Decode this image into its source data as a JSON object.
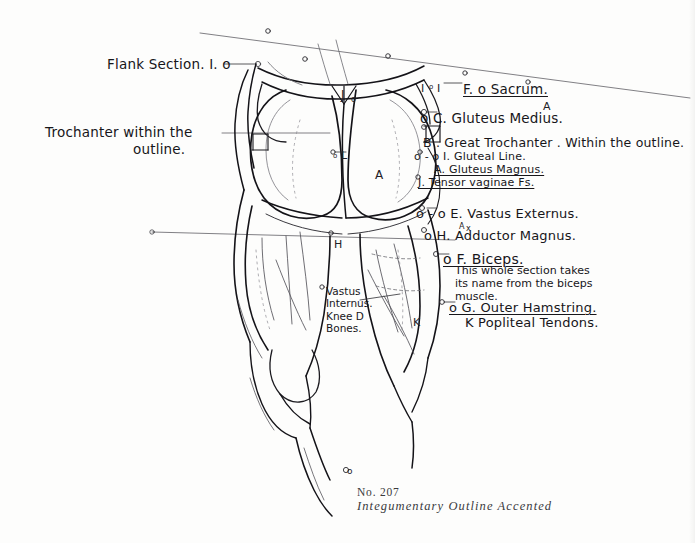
{
  "plate": {
    "number": "No.  207",
    "title": "Integumentary Outline Accented",
    "background_color": "#fdfdfc",
    "ink_color": "#17161a"
  },
  "left_annotations": [
    {
      "id": "flank-section",
      "text": "Flank Section. I. o",
      "x": 107,
      "y": 57,
      "size": 13.5
    },
    {
      "id": "trochanter-within-1",
      "text": "Trochanter within the",
      "x": 45,
      "y": 125,
      "size": 13.5
    },
    {
      "id": "trochanter-within-2",
      "text": "outline.",
      "x": 133,
      "y": 142,
      "size": 13.5
    }
  ],
  "right_annotations": [
    {
      "id": "sacrum",
      "text": "F. o  Sacrum.",
      "x": 463,
      "y": 82,
      "size": 13.5,
      "underline": true
    },
    {
      "id": "gluteus-medius",
      "text": "o  C. Gluteus Medius.",
      "x": 420,
      "y": 111,
      "size": 13.5,
      "underline": false
    },
    {
      "id": "great-trochanter",
      "text": "B . Great Trochanter . Within the outline.",
      "x": 423,
      "y": 136,
      "size": 12.5,
      "underline": false
    },
    {
      "id": "gluteal-line",
      "text": "o - o   I. Gluteal Line.",
      "x": 414,
      "y": 151,
      "size": 11,
      "underline": false
    },
    {
      "id": "gluteus-magnus",
      "text": "A. Gluteus Magnus.",
      "x": 434,
      "y": 164,
      "size": 11,
      "underline": true
    },
    {
      "id": "tensor-vaginae",
      "text": "J. Tensor vaginae Fs.",
      "x": 418,
      "y": 177,
      "size": 11,
      "underline": true
    },
    {
      "id": "vastus-externus",
      "text": "o - o  E. Vastus Externus.",
      "x": 416,
      "y": 207,
      "size": 13,
      "underline": false
    },
    {
      "id": "adductor-magnus",
      "text": "o H. Adductor Magnus.",
      "x": 424,
      "y": 229,
      "size": 13,
      "underline": false
    },
    {
      "id": "biceps",
      "text": "o  F. Biceps.",
      "x": 443,
      "y": 252,
      "size": 14,
      "underline": true
    },
    {
      "id": "outer-hamstring",
      "text": "o   G. Outer Hamstring.",
      "x": 449,
      "y": 301,
      "size": 13,
      "underline": true
    },
    {
      "id": "popliteal-tendons",
      "text": "K  Popliteal Tendons.",
      "x": 465,
      "y": 316,
      "size": 13,
      "underline": false
    }
  ],
  "note_block": {
    "id": "biceps-note",
    "x": 455,
    "y": 265,
    "size": 11,
    "lines": [
      "This whole section takes",
      "its name from the biceps",
      "muscle."
    ]
  },
  "center_annotations": {
    "id": "vastus-internus-knee",
    "x": 323,
    "y": 287,
    "size": 10.5,
    "lines": [
      {
        "text": "Vastus",
        "underline": false
      },
      {
        "text": "Internus.",
        "underline": false
      },
      {
        "text": "Knee D",
        "underline": true
      },
      {
        "text": "Bones.",
        "underline": true
      }
    ]
  },
  "figure_letters": [
    {
      "label": "J",
      "x": 341,
      "y": 88,
      "size": 12
    },
    {
      "label": "o",
      "x": 351,
      "y": 95,
      "size": 8
    },
    {
      "label": "I",
      "x": 421,
      "y": 82,
      "size": 11
    },
    {
      "label": "o",
      "x": 429,
      "y": 83,
      "size": 7
    },
    {
      "label": "I",
      "x": 437,
      "y": 82,
      "size": 11
    },
    {
      "label": "A",
      "x": 543,
      "y": 100,
      "size": 11
    },
    {
      "label": "L",
      "x": 341,
      "y": 149,
      "size": 11
    },
    {
      "label": "o",
      "x": 333,
      "y": 152,
      "size": 7
    },
    {
      "label": "A",
      "x": 375,
      "y": 168,
      "size": 12
    },
    {
      "label": "A",
      "x": 459,
      "y": 222,
      "size": 8
    },
    {
      "label": "x",
      "x": 466,
      "y": 224,
      "size": 8
    },
    {
      "label": "H",
      "x": 334,
      "y": 238,
      "size": 11
    },
    {
      "label": "K",
      "x": 413,
      "y": 316,
      "size": 11
    },
    {
      "label": "o",
      "x": 347,
      "y": 470,
      "size": 9
    }
  ]
}
